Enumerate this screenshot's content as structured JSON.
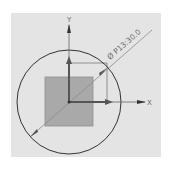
{
  "sketch": {
    "axes": {
      "x_label": "X",
      "y_label": "Y"
    },
    "dimension": {
      "symbol": "Ø",
      "text": "Ø P13:30.0",
      "value": "30.0",
      "parameter": "P13"
    },
    "colors": {
      "background": "#e4e4e4",
      "circle": "#333333",
      "square_fill": "#a9a9a9",
      "axis": "#444444",
      "dimension_line": "#7a7a7a"
    }
  }
}
